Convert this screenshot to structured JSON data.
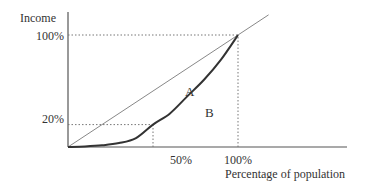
{
  "chart_data": {
    "type": "line",
    "title": "",
    "xlabel": "Percentage of population",
    "ylabel": "Income",
    "x_ticks": [
      "50%",
      "100%"
    ],
    "y_ticks": [
      "20%",
      "100%"
    ],
    "xlim": [
      0,
      1.8
    ],
    "ylim": [
      0,
      1.0
    ],
    "series": [
      {
        "name": "Line of equality",
        "x": [
          0,
          1.0,
          1.18
        ],
        "y": [
          0,
          1.0,
          1.18
        ]
      },
      {
        "name": "Lorenz curve",
        "x": [
          0,
          0.1,
          0.2,
          0.3,
          0.4,
          0.5,
          0.6,
          0.7,
          0.8,
          0.9,
          1.0
        ],
        "y": [
          0,
          0.005,
          0.015,
          0.035,
          0.08,
          0.2,
          0.3,
          0.45,
          0.6,
          0.78,
          1.0
        ]
      }
    ],
    "reference_lines": [
      {
        "type": "dotted",
        "from": [
          0,
          1.0
        ],
        "to": [
          1.0,
          1.0
        ]
      },
      {
        "type": "dotted",
        "from": [
          1.0,
          0
        ],
        "to": [
          1.0,
          1.0
        ]
      },
      {
        "type": "dotted",
        "from": [
          0,
          0.2
        ],
        "to": [
          0.5,
          0.2
        ]
      },
      {
        "type": "dotted",
        "from": [
          0.5,
          0
        ],
        "to": [
          0.5,
          0.2
        ]
      }
    ],
    "annotations": [
      {
        "text": "A",
        "x": 0.65,
        "y": 0.48
      },
      {
        "text": "B",
        "x": 0.75,
        "y": 0.3
      }
    ],
    "grid": false,
    "legend": "none"
  }
}
